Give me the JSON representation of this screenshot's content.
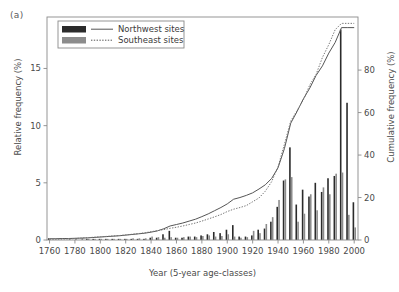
{
  "panel": {
    "label": "(a)"
  },
  "chart_data": {
    "type": "bar",
    "title": "",
    "subtitle": "",
    "xlabel": "Year (5-year age-classes)",
    "ylabel": "Relative frequency (%)",
    "y2label": "Cumulative frequency (%)",
    "xlim": [
      1758,
      2003
    ],
    "ylim": [
      0,
      19.5
    ],
    "y2lim": [
      0,
      105
    ],
    "grid": false,
    "legend_position": "top-left",
    "x_ticks": [
      1760,
      1780,
      1800,
      1820,
      1840,
      1860,
      1880,
      1900,
      1920,
      1940,
      1960,
      1980,
      2000
    ],
    "y_ticks": [
      0,
      5,
      10,
      15
    ],
    "y2_ticks": [
      0,
      20,
      40,
      60,
      80
    ],
    "bar_width_years": 2.2,
    "colors": {
      "northwest_bar": "#2b2b2b",
      "southeast_bar": "#8c8c8c",
      "northwest_line": "#555555",
      "southeast_line": "#777777",
      "axis": "#8a8a8a",
      "frame": "#8a8a8a"
    },
    "legend": [
      {
        "label": "Northwest sites",
        "bar_color": "#2b2b2b",
        "line_style": "solid"
      },
      {
        "label": "Southeast sites",
        "bar_color": "#8c8c8c",
        "line_style": "dotted"
      }
    ],
    "categories": [
      1760,
      1765,
      1770,
      1775,
      1780,
      1785,
      1790,
      1795,
      1800,
      1805,
      1810,
      1815,
      1820,
      1825,
      1830,
      1835,
      1840,
      1845,
      1850,
      1855,
      1860,
      1865,
      1870,
      1875,
      1880,
      1885,
      1890,
      1895,
      1900,
      1905,
      1910,
      1915,
      1920,
      1925,
      1930,
      1935,
      1940,
      1945,
      1950,
      1955,
      1960,
      1965,
      1970,
      1975,
      1980,
      1985,
      1990,
      1995,
      2000
    ],
    "series": [
      {
        "name": "Northwest sites",
        "type": "bar",
        "color": "#2b2b2b",
        "values": [
          0.15,
          0,
          0,
          0,
          0,
          0,
          0.1,
          0.1,
          0.1,
          0.1,
          0.1,
          0.1,
          0.1,
          0.1,
          0.1,
          0.1,
          0.2,
          0.2,
          0.5,
          0.8,
          0.2,
          0.2,
          0.3,
          0.3,
          0.4,
          0.5,
          0.7,
          0.6,
          0.9,
          1.3,
          0.3,
          0.3,
          0.4,
          0.9,
          1.0,
          1.6,
          2.9,
          5.2,
          8.1,
          3.1,
          4.4,
          3.8,
          5.0,
          4.2,
          5.4,
          5.6,
          18.4,
          12.0,
          3.3
        ]
      },
      {
        "name": "Southeast sites",
        "type": "bar",
        "color": "#8c8c8c",
        "values": [
          0,
          0,
          0,
          0.1,
          0.15,
          0.15,
          0.1,
          0.1,
          0.1,
          0.1,
          0.1,
          0.1,
          0.1,
          0.15,
          0.15,
          0.15,
          0.3,
          0.25,
          0.2,
          0.25,
          0.2,
          0.25,
          0.3,
          0.25,
          0.35,
          0.4,
          0.3,
          0.35,
          0.5,
          0.3,
          0.2,
          0.25,
          0.8,
          0.6,
          1.4,
          2.0,
          3.5,
          5.3,
          5.5,
          1.6,
          2.3,
          4.0,
          2.6,
          4.6,
          4.0,
          5.8,
          5.9,
          2.2,
          1.1
        ]
      },
      {
        "name": "Northwest sites",
        "type": "line",
        "axis": "y2",
        "style": "solid",
        "color": "#555555",
        "values": [
          0.6,
          0.6,
          0.7,
          0.7,
          0.8,
          0.9,
          1.0,
          1.2,
          1.4,
          1.6,
          1.8,
          2.0,
          2.3,
          2.6,
          2.9,
          3.2,
          3.7,
          4.3,
          5.3,
          6.6,
          7.3,
          8.0,
          8.9,
          9.8,
          11.0,
          12.3,
          13.8,
          15.3,
          17.0,
          19.2,
          20.0,
          21.0,
          22.2,
          24.0,
          26.0,
          29.0,
          34.0,
          43.0,
          55.0,
          60.5,
          66.5,
          71.5,
          77.5,
          82.0,
          88.0,
          93.0,
          100.0,
          100.0,
          100.0
        ]
      },
      {
        "name": "Southeast sites",
        "type": "line",
        "axis": "y2",
        "style": "dotted",
        "color": "#777777",
        "values": [
          0.3,
          0.3,
          0.4,
          0.5,
          0.7,
          0.9,
          1.1,
          1.3,
          1.5,
          1.7,
          1.9,
          2.1,
          2.4,
          2.7,
          3.0,
          3.4,
          3.9,
          4.4,
          4.9,
          5.5,
          6.0,
          6.6,
          7.3,
          8.0,
          8.9,
          9.9,
          10.9,
          12.0,
          13.4,
          14.5,
          15.3,
          16.2,
          18.0,
          19.8,
          23.0,
          27.5,
          34.5,
          45.0,
          56.0,
          61.0,
          66.0,
          73.0,
          78.0,
          86.0,
          92.0,
          99.0,
          102.0,
          102.0,
          102.0
        ]
      }
    ]
  }
}
